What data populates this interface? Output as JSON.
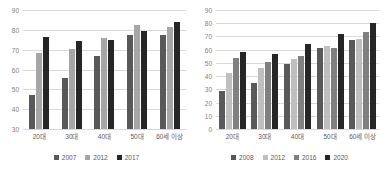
{
  "chart_data": [
    {
      "type": "bar",
      "title": "",
      "xlabel": "",
      "ylabel": "",
      "ylim": [
        30,
        90
      ],
      "yticks": [
        30,
        40,
        50,
        60,
        70,
        80,
        90
      ],
      "grid": true,
      "legend_position": "bottom",
      "categories": [
        "20대",
        "30대",
        "40대",
        "50대",
        "60세 이상"
      ],
      "series": [
        {
          "name": "2007",
          "color": "#595959",
          "values": [
            47,
            55.5,
            67,
            77.5,
            77.5
          ]
        },
        {
          "name": "2012",
          "color": "#a6a6a6",
          "values": [
            68.5,
            70.5,
            76,
            82.5,
            81.5
          ]
        },
        {
          "name": "2017",
          "color": "#262626",
          "values": [
            76.5,
            74.5,
            75,
            79.5,
            84
          ]
        }
      ]
    },
    {
      "type": "bar",
      "title": "",
      "xlabel": "",
      "ylabel": "",
      "ylim": [
        0,
        90
      ],
      "yticks": [
        0,
        10,
        20,
        30,
        40,
        50,
        60,
        70,
        80,
        90
      ],
      "grid": true,
      "legend_position": "bottom",
      "categories": [
        "20대",
        "30대",
        "40대",
        "50대",
        "60세 이상"
      ],
      "series": [
        {
          "name": "2008",
          "color": "#595959",
          "values": [
            28.5,
            35,
            49,
            61,
            67
          ]
        },
        {
          "name": "2012",
          "color": "#bfbfbf",
          "values": [
            42,
            46,
            53,
            63,
            68
          ]
        },
        {
          "name": "2016",
          "color": "#808080",
          "values": [
            53.5,
            51,
            55,
            61.5,
            73
          ]
        },
        {
          "name": "2020",
          "color": "#262626",
          "values": [
            58.5,
            57,
            64,
            72,
            80
          ]
        }
      ]
    }
  ]
}
